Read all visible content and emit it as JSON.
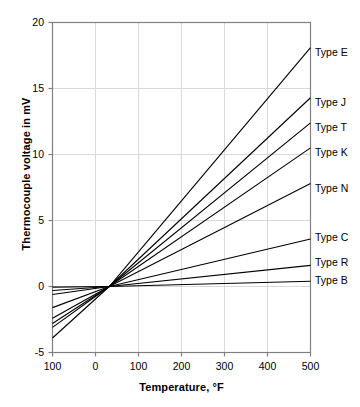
{
  "chart_data": {
    "type": "line",
    "title": "",
    "xlabel": "Temperature, °F",
    "ylabel": "Thermocouple voltage in mV",
    "xlim": [
      -100,
      500
    ],
    "ylim": [
      -5,
      20
    ],
    "xticks": [
      -100,
      0,
      100,
      200,
      300,
      400,
      500
    ],
    "xtick_labels": [
      "100",
      "0",
      "100",
      "200",
      "300",
      "400",
      "500"
    ],
    "yticks": [
      -5,
      0,
      5,
      10,
      15,
      20
    ],
    "ytick_labels": [
      "-5",
      "0",
      "5",
      "10",
      "15",
      "20"
    ],
    "grid": true,
    "legend_position": "right-inline-labels",
    "x": [
      -100,
      32,
      500
    ],
    "series": [
      {
        "name": "Type E",
        "label": "Type E",
        "values": [
          -3.9,
          0,
          18.1
        ],
        "label_y_mV": 17.7,
        "color": "#000000"
      },
      {
        "name": "Type J",
        "label": "Type J",
        "values": [
          -3.1,
          0,
          14.3
        ],
        "label_y_mV": 13.9,
        "color": "#000000"
      },
      {
        "name": "Type T",
        "label": "Type T",
        "values": [
          -2.8,
          0,
          12.4
        ],
        "label_y_mV": 12.0,
        "color": "#000000"
      },
      {
        "name": "Type K",
        "label": "Type K",
        "values": [
          -2.4,
          0,
          10.5
        ],
        "label_y_mV": 10.1,
        "color": "#000000"
      },
      {
        "name": "Type N",
        "label": "Type N",
        "values": [
          -1.6,
          0,
          7.8
        ],
        "label_y_mV": 7.4,
        "color": "#000000"
      },
      {
        "name": "Type C",
        "label": "Type C",
        "values": [
          -0.6,
          0,
          3.6
        ],
        "label_y_mV": 3.7,
        "color": "#000000"
      },
      {
        "name": "Type R",
        "label": "Type R",
        "values": [
          -0.3,
          0,
          1.6
        ],
        "label_y_mV": 1.8,
        "color": "#000000"
      },
      {
        "name": "Type B",
        "label": "Type B",
        "values": [
          -0.05,
          0,
          0.4
        ],
        "label_y_mV": 0.4,
        "color": "#000000"
      }
    ]
  },
  "axes": {
    "x_title": "Temperature, °F",
    "y_title": "Thermocouple voltage in mV"
  },
  "style": {
    "plot_border_color": "#808080",
    "grid_color": "#d9d9d9",
    "line_color": "#000000",
    "background": "#ffffff"
  }
}
